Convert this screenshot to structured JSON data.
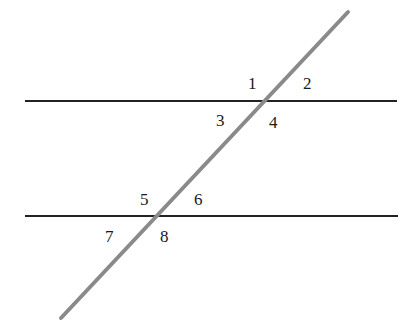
{
  "diagram": {
    "parallel_lines": [
      {
        "name": "upper-parallel-line",
        "x1": 25,
        "y1": 101,
        "x2": 397,
        "y2": 101,
        "color": "#222222"
      },
      {
        "name": "lower-parallel-line",
        "x1": 25,
        "y1": 216,
        "x2": 398,
        "y2": 216,
        "color": "#222222"
      }
    ],
    "transversal": {
      "x1": 348,
      "y1": 12,
      "x2": 61,
      "y2": 318,
      "color": "#8a8a8a"
    },
    "angle_labels": [
      {
        "text": "1",
        "x": 248,
        "y": 89
      },
      {
        "text": "2",
        "x": 303,
        "y": 89
      },
      {
        "text": "3",
        "x": 216,
        "y": 126
      },
      {
        "text": "4",
        "x": 269,
        "y": 128
      },
      {
        "text": "5",
        "x": 140,
        "y": 205
      },
      {
        "text": "6",
        "x": 194,
        "y": 205
      },
      {
        "text": "7",
        "x": 105,
        "y": 242
      },
      {
        "text": "8",
        "x": 160,
        "y": 242
      }
    ]
  }
}
